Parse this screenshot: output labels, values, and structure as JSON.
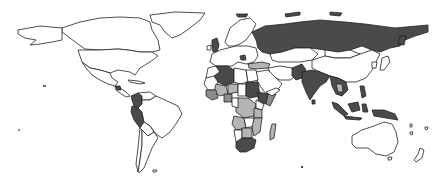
{
  "map": {
    "type": "choropleth",
    "projection": "world",
    "legend": null,
    "title": null,
    "colors": {
      "background": "#ffffff",
      "border": "#222222",
      "none": "#ffffff",
      "light": "#b5b5b5",
      "medium": "#8c8c8c",
      "dark": "#4a4a4a"
    },
    "regions": [
      {
        "name": "Canada",
        "category": "none"
      },
      {
        "name": "United States",
        "category": "none"
      },
      {
        "name": "Alaska",
        "category": "none"
      },
      {
        "name": "Greenland",
        "category": "none"
      },
      {
        "name": "Mexico",
        "category": "none"
      },
      {
        "name": "Central America",
        "category": "none"
      },
      {
        "name": "Guatemala",
        "category": "dark"
      },
      {
        "name": "Colombia",
        "category": "dark"
      },
      {
        "name": "Peru",
        "category": "dark"
      },
      {
        "name": "Venezuela",
        "category": "none"
      },
      {
        "name": "Brazil",
        "category": "none"
      },
      {
        "name": "Argentina",
        "category": "none"
      },
      {
        "name": "Chile",
        "category": "none"
      },
      {
        "name": "Bolivia",
        "category": "none"
      },
      {
        "name": "United Kingdom",
        "category": "dark"
      },
      {
        "name": "Europe (various)",
        "category": "none"
      },
      {
        "name": "Russia",
        "category": "dark"
      },
      {
        "name": "Kazakhstan",
        "category": "none"
      },
      {
        "name": "China",
        "category": "none"
      },
      {
        "name": "Mongolia",
        "category": "none"
      },
      {
        "name": "India",
        "category": "dark"
      },
      {
        "name": "Pakistan",
        "category": "dark"
      },
      {
        "name": "Iran",
        "category": "none"
      },
      {
        "name": "Turkey",
        "category": "light"
      },
      {
        "name": "Southeast Asia",
        "category": "dark"
      },
      {
        "name": "Thailand",
        "category": "light"
      },
      {
        "name": "Indonesia",
        "category": "dark"
      },
      {
        "name": "Philippines",
        "category": "dark"
      },
      {
        "name": "Papua New Guinea",
        "category": "dark"
      },
      {
        "name": "Australia",
        "category": "none"
      },
      {
        "name": "New Zealand",
        "category": "none"
      },
      {
        "name": "Japan",
        "category": "none"
      },
      {
        "name": "Algeria",
        "category": "dark"
      },
      {
        "name": "Libya",
        "category": "none"
      },
      {
        "name": "Egypt",
        "category": "none"
      },
      {
        "name": "Sudan",
        "category": "dark"
      },
      {
        "name": "Mali",
        "category": "light"
      },
      {
        "name": "Niger",
        "category": "light"
      },
      {
        "name": "Nigeria",
        "category": "medium"
      },
      {
        "name": "Ethiopia",
        "category": "dark"
      },
      {
        "name": "DR Congo",
        "category": "light"
      },
      {
        "name": "Angola",
        "category": "light"
      },
      {
        "name": "Tanzania",
        "category": "light"
      },
      {
        "name": "Zambia",
        "category": "none"
      },
      {
        "name": "Mozambique",
        "category": "light"
      },
      {
        "name": "Namibia",
        "category": "none"
      },
      {
        "name": "South Africa",
        "category": "dark"
      },
      {
        "name": "Madagascar",
        "category": "light"
      },
      {
        "name": "Saudi Arabia",
        "category": "none"
      }
    ]
  }
}
